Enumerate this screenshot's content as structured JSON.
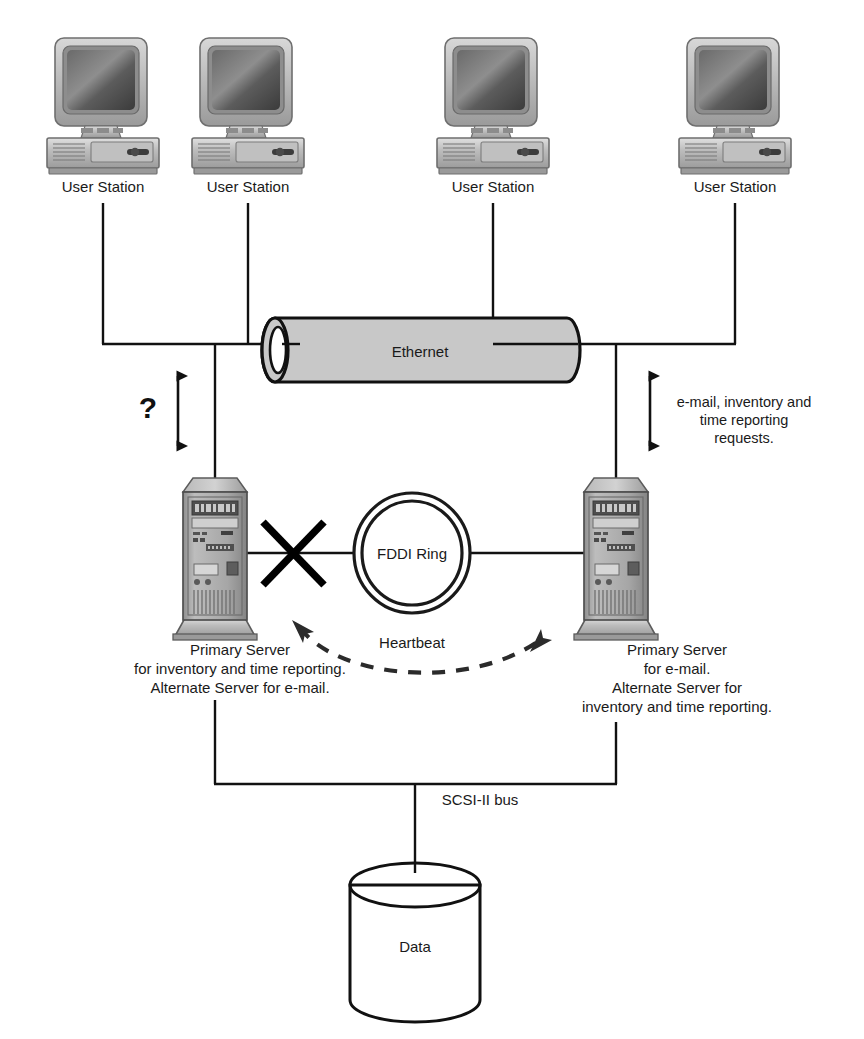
{
  "diagram": {
    "colors": {
      "ink": "#111111",
      "ethernet_fill": "#c8c8c8",
      "ethernet_stroke": "#111111",
      "workstation_body": "#b4b4b4",
      "workstation_screen": "#4a4a4a",
      "tower_body": "#a8a8a8",
      "dash_arrow": "#2b2b2b",
      "background": "#ffffff"
    },
    "workstations": [
      {
        "label": "User Station",
        "x": 103
      },
      {
        "label": "User Station",
        "x": 248
      },
      {
        "label": "User Station",
        "x": 493
      },
      {
        "label": "User Station",
        "x": 735
      }
    ],
    "ethernet": {
      "label": "Ethernet",
      "cx": 420,
      "cy": 345
    },
    "left_link": {
      "annotation": "?",
      "arrow": "double-headed-vertical"
    },
    "right_link": {
      "annotation_lines": [
        "e-mail, inventory and",
        "time reporting",
        "requests."
      ],
      "arrow": "double-headed-vertical"
    },
    "ring": {
      "label": "FDDI Ring",
      "sublabel": "Heartbeat",
      "cx": 412,
      "cy": 553
    },
    "fault": {
      "marker": "X",
      "meaning": "link failure"
    },
    "failover": {
      "style": "dashed-double-arrow",
      "meaning": "failover"
    },
    "servers": [
      {
        "id": "left-server",
        "caption_lines": [
          "Primary Server",
          "for inventory and time reporting.",
          "Alternate Server for e-mail."
        ]
      },
      {
        "id": "right-server",
        "caption_lines": [
          "Primary Server",
          "for e-mail.",
          "Alternate Server for",
          "inventory and time reporting."
        ]
      }
    ],
    "storage_bus": {
      "label": "SCSI-II bus"
    },
    "storage": {
      "label": "Data"
    }
  }
}
